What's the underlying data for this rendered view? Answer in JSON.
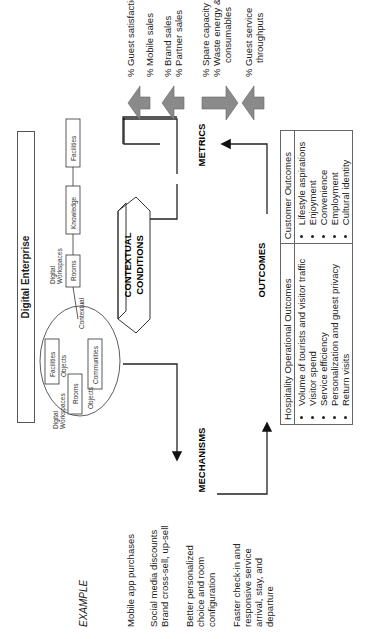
{
  "header": {
    "title": "Digital Enterprise"
  },
  "example": {
    "title": "EXAMPLE",
    "items": [
      [
        "Mobile app purchases"
      ],
      [
        "Social media discounts",
        "Brand cross-sell, up-sell"
      ],
      [
        "Better personalized",
        "choice and room",
        "configuration"
      ],
      [
        "Faster check-in and",
        "responsive service",
        "arrival, stay, and",
        "departure"
      ]
    ]
  },
  "cycle": {
    "mechanisms": "MECHANISMS",
    "metrics": "METRICS",
    "outcomes": "OUTCOMES",
    "contextual_1": "CONTEXTUAL",
    "contextual_2": "CONDITIONS"
  },
  "enterprise_diagram": {
    "left_cluster": {
      "digital_workspaces_1": "Digital",
      "digital_workspaces_2": "Workspaces",
      "rooms": "Rooms",
      "objects_1": "Objects",
      "facilities": "Facilities",
      "objects_2": "Objects",
      "communities": "Communities",
      "contextual": "Contextual"
    },
    "right_chain": {
      "digital_workspaces_1": "Digital",
      "digital_workspaces_2": "Workspaces",
      "rooms": "Rooms",
      "knowledge": "Knowledge",
      "facilities": "Facilities"
    }
  },
  "metrics_list": [
    {
      "lines": [
        "% Guest satisfaction",
        "% Mobile sales"
      ],
      "direction": "up"
    },
    {
      "lines": [
        "% Brand sales",
        "% Partner sales"
      ],
      "direction": "up"
    },
    {
      "lines": [
        "% Spare capacity",
        "% Waste energy &",
        "consumables"
      ],
      "direction": "down"
    },
    {
      "lines": [
        "% Guest service",
        "throughputs"
      ],
      "direction": "up"
    }
  ],
  "outcomes_table": {
    "headers": [
      "Hospitality Operational Outcomes",
      "Customer Outcomes"
    ],
    "hospitality": [
      "Volume of tourists and visitor traffic",
      "Visitor spend",
      "Service efficiency",
      "Personalization and guest privacy",
      "Return visits"
    ],
    "customer": [
      "Lifestyle aspirations",
      "Enjoyment",
      "Convenience",
      "Employment",
      "Cultural identity"
    ]
  },
  "colors": {
    "arrow_fill": "#8a8a8a",
    "line": "#222222",
    "border": "#666666"
  }
}
